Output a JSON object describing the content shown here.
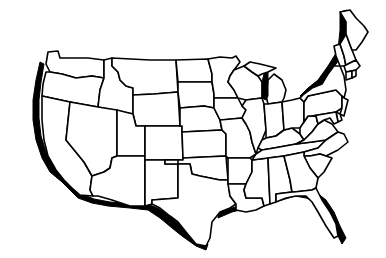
{
  "map": {
    "title": "United States outline map",
    "region": "Contiguous United States",
    "style": "black outline with drop shadow",
    "colors": {
      "background": "#ffffff",
      "outline": "#000000",
      "fill": "#ffffff",
      "shadow": "#000000"
    },
    "states": [
      "WA",
      "OR",
      "CA",
      "ID",
      "NV",
      "MT",
      "WY",
      "UT",
      "AZ",
      "CO",
      "NM",
      "ND",
      "SD",
      "NE",
      "KS",
      "OK",
      "TX",
      "MN",
      "IA",
      "MO",
      "AR",
      "LA",
      "WI",
      "IL",
      "MS",
      "MI",
      "IN",
      "KY",
      "TN",
      "AL",
      "OH",
      "WV",
      "VA",
      "NC",
      "SC",
      "GA",
      "FL",
      "PA",
      "NY",
      "VT",
      "NH",
      "ME",
      "MA",
      "CT",
      "RI",
      "NJ",
      "DE",
      "MD"
    ]
  }
}
